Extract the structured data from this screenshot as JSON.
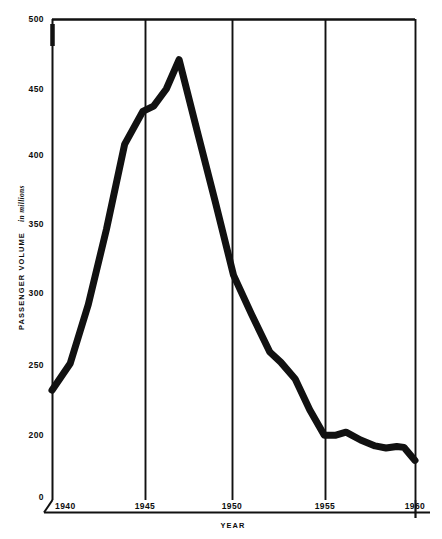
{
  "chart_data": {
    "type": "line",
    "title": "",
    "xlabel": "YEAR",
    "ylabel": "PASSENGER VOLUME",
    "ylabel_sub": "in millions",
    "xlim": [
      1940,
      1960
    ],
    "ylim": [
      0,
      500
    ],
    "y_axis_broken": true,
    "y_break_note": "axis compressed between 0 and 200",
    "grid": "vertical-only",
    "legend": "none",
    "x_ticks": [
      "1940",
      "1945",
      "1950",
      "1955",
      "1960"
    ],
    "x_tick_values": [
      1940,
      1945,
      1950,
      1955,
      1960
    ],
    "y_ticks": [
      "0",
      "200",
      "250",
      "300",
      "350",
      "400",
      "450",
      "500"
    ],
    "y_tick_values": [
      0,
      200,
      250,
      300,
      350,
      400,
      450,
      500
    ],
    "series": [
      {
        "name": "Passenger Volume",
        "color": "#111111",
        "line_width_px": 7,
        "x": [
          1940,
          1941,
          1942,
          1943,
          1944,
          1945,
          1945.6,
          1946.3,
          1947,
          1948,
          1949,
          1950,
          1951,
          1952,
          1952.6,
          1953.4,
          1954.2,
          1955,
          1955.6,
          1956.2,
          1957,
          1957.8,
          1958.4,
          1959,
          1959.4,
          1960
        ],
        "values": [
          232,
          251,
          292,
          346,
          408,
          433,
          437,
          450,
          471,
          418,
          366,
          313,
          285,
          259,
          252,
          240,
          218,
          199,
          199,
          202,
          184,
          165,
          158,
          163,
          160,
          118
        ]
      }
    ],
    "annotations": []
  },
  "axes": {
    "x_axis_title": "YEAR",
    "y_axis_title": "PASSENGER VOLUME",
    "y_axis_title_units": "in millions"
  },
  "colors": {
    "line": "#111111",
    "axis": "#111111",
    "grid": "#111111",
    "background": "#ffffff",
    "text": "#0d0d0d"
  },
  "geometry": {
    "plot_left": 52,
    "plot_right": 415,
    "plot_top": 19,
    "plot_bottom": 497,
    "gridlines_x_px": [
      52,
      145,
      232,
      325,
      415
    ],
    "y_pixel_map": [
      {
        "value": 500,
        "y": 19
      },
      {
        "value": 450,
        "y": 89
      },
      {
        "value": 400,
        "y": 155
      },
      {
        "value": 350,
        "y": 224
      },
      {
        "value": 300,
        "y": 293
      },
      {
        "value": 250,
        "y": 365
      },
      {
        "value": 200,
        "y": 435
      },
      {
        "value": 0,
        "y": 497
      }
    ]
  }
}
